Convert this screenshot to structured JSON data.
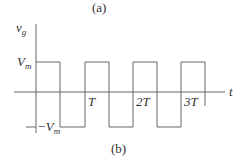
{
  "captions": {
    "top": "(a)",
    "bottom": "(b)"
  },
  "axes": {
    "y_label": "v",
    "y_label_sub": "g",
    "x_label": "t"
  },
  "levels": {
    "high_label": "V",
    "high_sub": "m",
    "low_label": "−V",
    "low_sub": "m"
  },
  "ticks": [
    "T",
    "2T",
    "3T"
  ],
  "colors": {
    "line": "#666666",
    "text": "#333333"
  }
}
